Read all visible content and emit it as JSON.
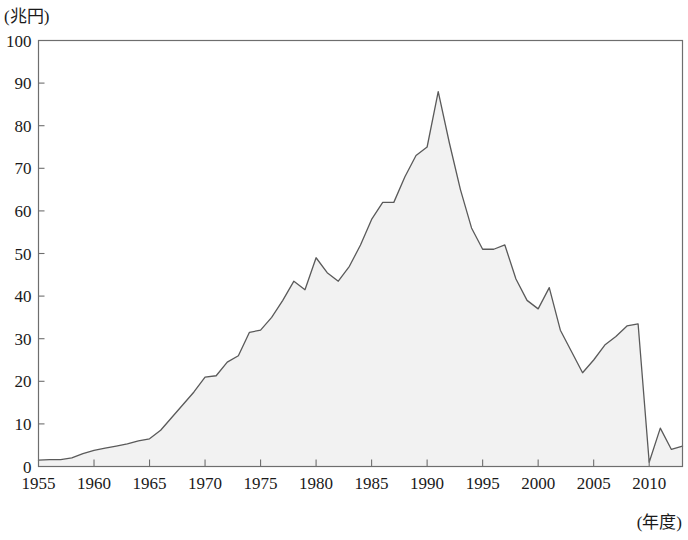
{
  "axes": {
    "y_unit_label": "(兆円)",
    "x_unit_label": "(年度)",
    "y_ticks": [
      "0",
      "10",
      "20",
      "30",
      "40",
      "50",
      "60",
      "70",
      "80",
      "90",
      "100"
    ],
    "x_ticks": [
      "1955",
      "1960",
      "1965",
      "1970",
      "1975",
      "1980",
      "1985",
      "1990",
      "1995",
      "2000",
      "2005",
      "2010"
    ]
  },
  "style": {
    "area_fill": "#f2f2f2",
    "line_color": "#5a5a5a",
    "frame_color": "#6e6e6e",
    "background": "#ffffff"
  },
  "chart_data": {
    "type": "area",
    "title": "",
    "subtitle": "",
    "xlabel": "(年度)",
    "ylabel": "(兆円)",
    "xlim": [
      1955,
      2013
    ],
    "ylim": [
      0,
      100
    ],
    "grid": false,
    "legend": "none",
    "x_tick_step": 5,
    "y_tick_step": 10,
    "x": [
      1955,
      1956,
      1957,
      1958,
      1959,
      1960,
      1961,
      1962,
      1963,
      1964,
      1965,
      1966,
      1967,
      1968,
      1969,
      1970,
      1971,
      1972,
      1973,
      1974,
      1975,
      1976,
      1977,
      1978,
      1979,
      1980,
      1981,
      1982,
      1983,
      1984,
      1985,
      1986,
      1987,
      1988,
      1989,
      1990,
      1991,
      1992,
      1993,
      1994,
      1995,
      1996,
      1997,
      1998,
      1999,
      2000,
      2001,
      2002,
      2003,
      2004,
      2005,
      2006,
      2007,
      2008,
      2009,
      2010,
      2011,
      2012,
      2013
    ],
    "values": [
      1.5,
      1.6,
      1.6,
      2.0,
      3.0,
      3.8,
      4.3,
      4.8,
      5.3,
      6.0,
      6.5,
      8.5,
      11.5,
      14.5,
      17.5,
      21.0,
      21.3,
      24.5,
      26.0,
      31.5,
      32.0,
      35.0,
      39.0,
      43.5,
      41.5,
      49.0,
      45.5,
      43.5,
      47.0,
      52.0,
      58.0,
      62.0,
      62.0,
      68.0,
      73.0,
      75.0,
      88.0,
      76.0,
      65.0,
      56.0,
      51.0,
      51.0,
      52.0,
      44.0,
      39.0,
      37.0,
      42.0,
      32.0,
      27.0,
      22.0,
      25.0,
      28.5,
      30.5,
      33.0,
      33.5,
      1.0,
      9.0,
      4.0,
      4.8
    ],
    "series": [
      {
        "name": "建設投資額",
        "values": [
          1.5,
          1.6,
          1.6,
          2.0,
          3.0,
          3.8,
          4.3,
          4.8,
          5.3,
          6.0,
          6.5,
          8.5,
          11.5,
          14.5,
          17.5,
          21.0,
          21.3,
          24.5,
          26.0,
          31.5,
          32.0,
          35.0,
          39.0,
          43.5,
          41.5,
          49.0,
          45.5,
          43.5,
          47.0,
          52.0,
          58.0,
          62.0,
          62.0,
          68.0,
          73.0,
          75.0,
          88.0,
          76.0,
          65.0,
          56.0,
          51.0,
          51.0,
          52.0,
          44.0,
          39.0,
          37.0,
          42.0,
          32.0,
          27.0,
          22.0,
          25.0,
          28.5,
          30.5,
          33.0,
          33.5,
          1.0,
          9.0,
          4.0,
          4.8
        ]
      }
    ],
    "peak": {
      "x": 1991,
      "y": 88
    },
    "annotations": []
  }
}
